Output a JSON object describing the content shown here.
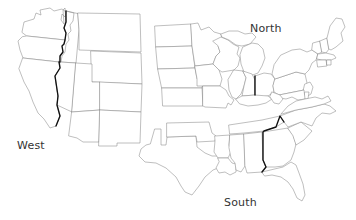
{
  "figure": {
    "kind": "us-regions-map",
    "width": 356,
    "height": 220,
    "background_color": "#ffffff",
    "state_outline_color": "#8a8a8a",
    "divider_color": "#111111",
    "label_color": "#333333"
  },
  "labels": {
    "west": "West",
    "north": "North",
    "south": "South"
  },
  "regions": [
    {
      "id": "west",
      "label": "West",
      "label_x": 17,
      "label_y": 139
    },
    {
      "id": "north",
      "label": "North",
      "label_x": 250,
      "label_y": 22
    },
    {
      "id": "south",
      "label": "South",
      "label_x": 224,
      "label_y": 196
    }
  ],
  "dividers": [
    {
      "id": "west-divider",
      "description": "bold border along Washington/Oregon-Idaho and California-Nevada line"
    },
    {
      "id": "north-divider",
      "description": "bold vertical border between Indiana and Ohio"
    },
    {
      "id": "south-divider",
      "description": "bold border along Tennessee-North Carolina and Alabama-Georgia line"
    }
  ]
}
